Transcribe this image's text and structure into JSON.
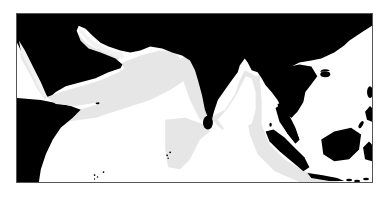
{
  "map": {
    "type": "range-map",
    "region": "Indian Ocean and surrounding coasts",
    "colors": {
      "land": "#000000",
      "ocean": "#ffffff",
      "range": "#e6e6e6",
      "frame": "#555555"
    },
    "legend": [],
    "labels": []
  }
}
